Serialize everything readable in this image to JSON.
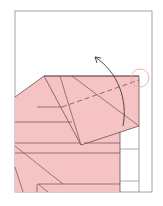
{
  "diagram": {
    "type": "origami-fold-step",
    "colors": {
      "paper_colored": "#f6c3c5",
      "paper_white": "#ffffff",
      "line": "#6e4f52",
      "frame": "#9a9a9a",
      "highlight_circle": "#e8a9ac",
      "arrow": "#3a3a3a"
    },
    "elements": {
      "frame": "page-frame",
      "fold_line": "dashed-valley-fold",
      "arrow": "fold-up-arrow",
      "marker": "reference-circle"
    }
  }
}
